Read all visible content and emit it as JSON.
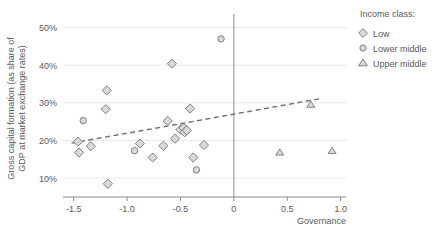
{
  "chart_data": {
    "type": "scatter",
    "title": "",
    "xlabel": "Governance",
    "ylabel": "Gross capital formation (as share of GDP at market exchange rates)",
    "xlim": [
      -1.6,
      1.05
    ],
    "ylim": [
      0.05,
      0.52
    ],
    "grid": true,
    "xticks": [
      -1.5,
      -1.0,
      -0.5,
      0,
      0.5,
      1.0
    ],
    "xtick_labels": [
      "-1.5",
      "-1.0",
      "-0.5",
      "0",
      "0.5",
      "1.0"
    ],
    "yticks": [
      0.1,
      0.2,
      0.3,
      0.4,
      0.5
    ],
    "ytick_labels": [
      "10%",
      "20%",
      "30%",
      "40%",
      "50%"
    ],
    "legend_position": "right",
    "legend_title": "Income class:",
    "series": [
      {
        "name": "Low",
        "marker": "diamond",
        "points": [
          [
            -1.46,
            0.197
          ],
          [
            -1.45,
            0.168
          ],
          [
            -1.34,
            0.185
          ],
          [
            -1.19,
            0.333
          ],
          [
            -1.2,
            0.283
          ],
          [
            -1.18,
            0.085
          ],
          [
            -0.88,
            0.192
          ],
          [
            -0.76,
            0.155
          ],
          [
            -0.66,
            0.186
          ],
          [
            -0.62,
            0.252
          ],
          [
            -0.58,
            0.404
          ],
          [
            -0.55,
            0.205
          ],
          [
            -0.5,
            0.229
          ],
          [
            -0.47,
            0.233
          ],
          [
            -0.46,
            0.222
          ],
          [
            -0.44,
            0.227
          ],
          [
            -0.41,
            0.285
          ],
          [
            -0.38,
            0.155
          ],
          [
            -0.28,
            0.188
          ]
        ]
      },
      {
        "name": "Lower middle",
        "marker": "circle",
        "points": [
          [
            -1.41,
            0.253
          ],
          [
            -0.93,
            0.173
          ],
          [
            -0.35,
            0.122
          ],
          [
            -0.12,
            0.47
          ]
        ]
      },
      {
        "name": "Upper middle",
        "marker": "triangle",
        "points": [
          [
            0.43,
            0.168
          ],
          [
            0.72,
            0.295
          ],
          [
            0.92,
            0.172
          ]
        ]
      }
    ],
    "trendline": {
      "name": "linear-fit",
      "style": "dashed",
      "x_start": -1.52,
      "y_start": 0.193,
      "x_end": 0.83,
      "y_end": 0.312
    },
    "legend_entries": [
      {
        "label": "Low",
        "marker": "diamond"
      },
      {
        "label": "Lower middle",
        "marker": "circle"
      },
      {
        "label": "Upper middle",
        "marker": "triangle"
      }
    ],
    "colors": {
      "marker_fill": "#d9d9d9",
      "marker_stroke": "#808080",
      "gridline": "#e8e8e8",
      "axis": "#8c8c8c",
      "text": "#595959",
      "trendline": "#6e6e6e"
    }
  }
}
